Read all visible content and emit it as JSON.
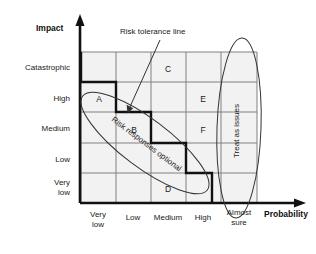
{
  "diagram": {
    "type": "risk-matrix",
    "axes": {
      "y": {
        "title": "Impact",
        "ticks": [
          "Catastrophic",
          "High",
          "Medium",
          "Low",
          "Very low"
        ],
        "ticks_display": [
          "Catastrophic",
          "High",
          "Medium",
          "Low",
          "Very\nlow"
        ]
      },
      "x": {
        "title": "Probability",
        "ticks": [
          "Very low",
          "Low",
          "Medium",
          "High",
          "Almost sure"
        ],
        "ticks_display": [
          "Very\nlow",
          "Low",
          "Medium",
          "High",
          "Almost\nsure"
        ]
      }
    },
    "grid": {
      "columns": 5,
      "rows": 5,
      "fill_color": "#f2f2f2",
      "line_color": "#808080"
    },
    "cells": [
      {
        "label": "C",
        "column": 3,
        "row": 1
      },
      {
        "label": "A",
        "column": 1,
        "row": 2
      },
      {
        "label": "E",
        "column": 4,
        "row": 2
      },
      {
        "label": "B",
        "column": 2,
        "row": 3
      },
      {
        "label": "F",
        "column": 4,
        "row": 3
      },
      {
        "label": "D",
        "column": 3,
        "row": 5
      }
    ],
    "annotations": [
      {
        "name": "risk-tolerance-line",
        "text": "Risk tolerance line"
      }
    ],
    "regions": [
      {
        "name": "risk-responses-optional",
        "text": "Risk responses optional",
        "shape": "ellipse",
        "orientation": "diagonal"
      },
      {
        "name": "treat-as-issues",
        "text": "Treat as issues",
        "shape": "ellipse",
        "orientation": "vertical"
      }
    ],
    "colors": {
      "ink": "#1a1a1a",
      "grid_line": "#808080",
      "cell_fill": "#f2f2f2",
      "tolerance_line": "#111111",
      "ellipse_line": "#333333"
    }
  }
}
